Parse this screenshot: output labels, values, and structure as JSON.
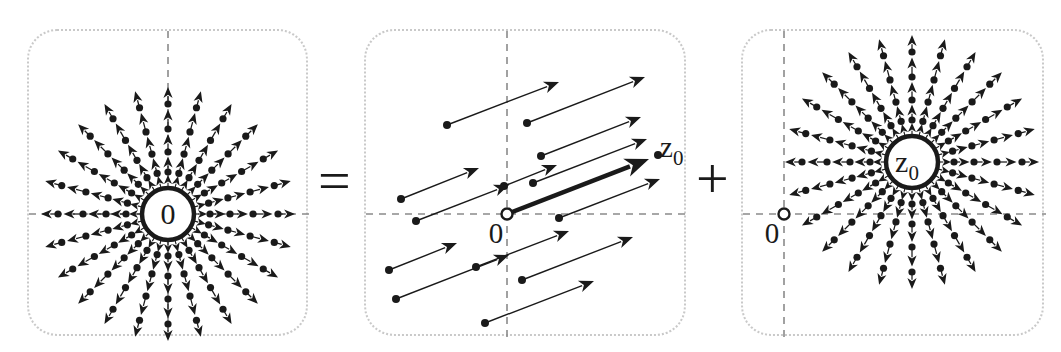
{
  "figure": {
    "background_color": "#ffffff",
    "ink_color": "#1a1a1a",
    "axis_color": "#8a8a8a",
    "panel_border_color": "#c9c9c9"
  },
  "operators": [
    {
      "id": "equals",
      "symbol": "=",
      "x": 318,
      "y": 152
    },
    {
      "id": "plus",
      "symbol": "+",
      "x": 696,
      "y": 150
    }
  ],
  "panels": [
    {
      "id": "panel-left",
      "name": "radial-field-at-origin",
      "x": 27,
      "y": 29,
      "width": 281,
      "height": 307,
      "field_type": "radial",
      "center": {
        "x": 139,
        "y": 183
      },
      "center_label": "0",
      "center_label_sub": "",
      "origin_marker": null,
      "axes": {
        "horizontal_y": 183,
        "vertical_x": 139,
        "style": "dashed"
      },
      "hub_radius": 30,
      "spoke_count": 24,
      "ring_radii": [
        42,
        62,
        85,
        110
      ],
      "outer_arrow_radius": 128
    },
    {
      "id": "panel-middle",
      "name": "uniform-field-with-z0-vector",
      "x": 364,
      "y": 29,
      "width": 322,
      "height": 307,
      "field_type": "uniform",
      "center": null,
      "center_label": "",
      "origin_marker": {
        "x": 141,
        "y": 183,
        "label": "0",
        "label_x": 130,
        "label_y": 212
      },
      "axes": {
        "horizontal_y": 183,
        "vertical_x": 141,
        "style": "dashed"
      },
      "arrow_angle_degrees": -21,
      "highlight_vector": {
        "from_x": 141,
        "from_y": 183,
        "to_x": 283,
        "to_y": 128,
        "label": "z",
        "label_sub": "0",
        "label_x": 294,
        "label_y": 126,
        "endpoint_dot": true,
        "bold": true
      },
      "arrows": [
        {
          "x1": 35,
          "y1": 168,
          "x2": 113,
          "y2": 137
        },
        {
          "x1": 23,
          "y1": 239,
          "x2": 91,
          "y2": 212
        },
        {
          "x1": 110,
          "y1": 236,
          "x2": 203,
          "y2": 200
        },
        {
          "x1": 81,
          "y1": 94,
          "x2": 193,
          "y2": 51
        },
        {
          "x1": 161,
          "y1": 92,
          "x2": 279,
          "y2": 46
        },
        {
          "x1": 138,
          "y1": 155,
          "x2": 191,
          "y2": 134
        },
        {
          "x1": 175,
          "y1": 125,
          "x2": 275,
          "y2": 86
        },
        {
          "x1": 193,
          "y1": 187,
          "x2": 294,
          "y2": 148
        },
        {
          "x1": 167,
          "y1": 152,
          "x2": 281,
          "y2": 108
        },
        {
          "x1": 50,
          "y1": 190,
          "x2": 143,
          "y2": 154
        },
        {
          "x1": 30,
          "y1": 268,
          "x2": 143,
          "y2": 224
        },
        {
          "x1": 156,
          "y1": 249,
          "x2": 267,
          "y2": 206
        },
        {
          "x1": 119,
          "y1": 292,
          "x2": 228,
          "y2": 250
        }
      ]
    },
    {
      "id": "panel-right",
      "name": "radial-field-at-z0",
      "x": 741,
      "y": 29,
      "width": 303,
      "height": 307,
      "field_type": "radial",
      "center": {
        "x": 169,
        "y": 131
      },
      "center_label": "z",
      "center_label_sub": "0",
      "origin_marker": {
        "x": 41,
        "y": 183,
        "label": "0",
        "label_x": 29,
        "label_y": 212
      },
      "axes": {
        "horizontal_y": 183,
        "vertical_x": 41,
        "style": "dashed"
      },
      "hub_radius": 30,
      "spoke_count": 24,
      "ring_radii": [
        42,
        62,
        85,
        110
      ],
      "outer_arrow_radius": 128
    }
  ]
}
